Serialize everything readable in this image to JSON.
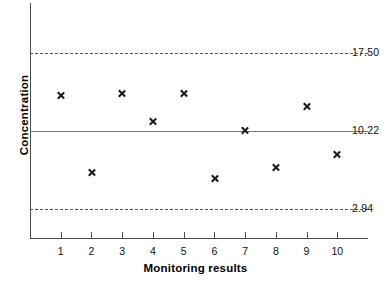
{
  "chart_data": {
    "type": "scatter",
    "title": "",
    "xlabel": "Monitoring results",
    "ylabel": "Concentration",
    "categories": [
      "1",
      "2",
      "3",
      "4",
      "5",
      "6",
      "7",
      "8",
      "9",
      "10"
    ],
    "x": [
      1,
      2,
      3,
      4,
      5,
      6,
      7,
      8,
      9,
      10
    ],
    "values": [
      13.5,
      6.3,
      13.7,
      11.05,
      13.65,
      5.7,
      10.22,
      6.8,
      12.45,
      8.0
    ],
    "xlim": [
      0,
      11
    ],
    "ylim": [
      0.3,
      22.0
    ],
    "grid": false,
    "legend": null,
    "marker": "x",
    "marker_color": "#1a1a1a",
    "reference_lines": [
      {
        "name": "upper-control-limit",
        "value": 17.5,
        "label": "17.50",
        "style": "dashed",
        "color": "#555555"
      },
      {
        "name": "center-line",
        "value": 10.22,
        "label": "10.22",
        "style": "solid",
        "color": "#7a7a7a"
      },
      {
        "name": "lower-control-limit",
        "value": 2.94,
        "label": "2.94",
        "style": "dashed",
        "color": "#555555"
      }
    ],
    "axis_color": "#4d4d4d"
  }
}
